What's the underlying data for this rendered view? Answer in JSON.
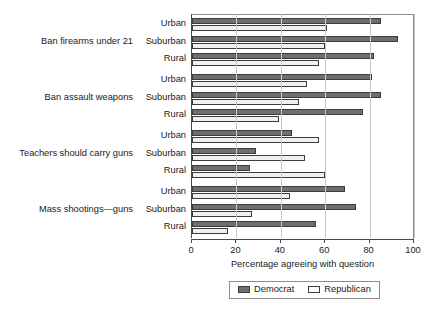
{
  "chart_data": {
    "type": "bar",
    "orientation": "horizontal",
    "title": "",
    "xlabel": "Percentage agreeing with question",
    "ylabel": "",
    "xlim": [
      0,
      100
    ],
    "xticks": [
      0,
      20,
      40,
      60,
      80,
      100
    ],
    "xtick_labels": [
      "0",
      "20",
      "40",
      "60",
      "80",
      "100"
    ],
    "grid": true,
    "grid_axis": "x",
    "legend_position": "bottom",
    "legend": [
      "Democrat",
      "Republican"
    ],
    "series": [
      {
        "name": "Democrat",
        "color": "#6e6e6e",
        "values": [
          85,
          93,
          82,
          81,
          85,
          77,
          45,
          29,
          26,
          69,
          74,
          56
        ]
      },
      {
        "name": "Republican",
        "color": "#f2f0ee",
        "values": [
          61,
          60,
          57,
          52,
          48,
          39,
          57,
          51,
          60,
          44,
          27,
          16
        ]
      }
    ],
    "groups": [
      {
        "label": "Ban firearms under 21",
        "categories": [
          "Urban",
          "Suburban",
          "Rural"
        ],
        "Democrat": [
          85,
          93,
          82
        ],
        "Republican": [
          61,
          60,
          57
        ]
      },
      {
        "label": "Ban assault weapons",
        "categories": [
          "Urban",
          "Suburban",
          "Rural"
        ],
        "Democrat": [
          81,
          85,
          77
        ],
        "Republican": [
          52,
          48,
          39
        ]
      },
      {
        "label": "Teachers should carry guns",
        "categories": [
          "Urban",
          "Suburban",
          "Rural"
        ],
        "Democrat": [
          45,
          29,
          26
        ],
        "Republican": [
          57,
          51,
          60
        ]
      },
      {
        "label": "Mass shootings—guns",
        "categories": [
          "Urban",
          "Suburban",
          "Rural"
        ],
        "Democrat": [
          69,
          74,
          56
        ],
        "Republican": [
          44,
          27,
          16
        ]
      }
    ]
  },
  "axis": {
    "x_title": "Percentage agreeing with question",
    "ticks": [
      "0",
      "20",
      "40",
      "60",
      "80",
      "100"
    ]
  },
  "legend": {
    "items": [
      {
        "label": "Democrat",
        "swatch": "dem"
      },
      {
        "label": "Republican",
        "swatch": "rep"
      }
    ]
  },
  "colors": {
    "democrat": "#6e6e6e",
    "republican": "#f2f0ee",
    "bar_outline": "#3c3c3c",
    "gridline": "#c9c9c9",
    "axis": "#4a4a4a",
    "text": "#1a1a1a"
  }
}
